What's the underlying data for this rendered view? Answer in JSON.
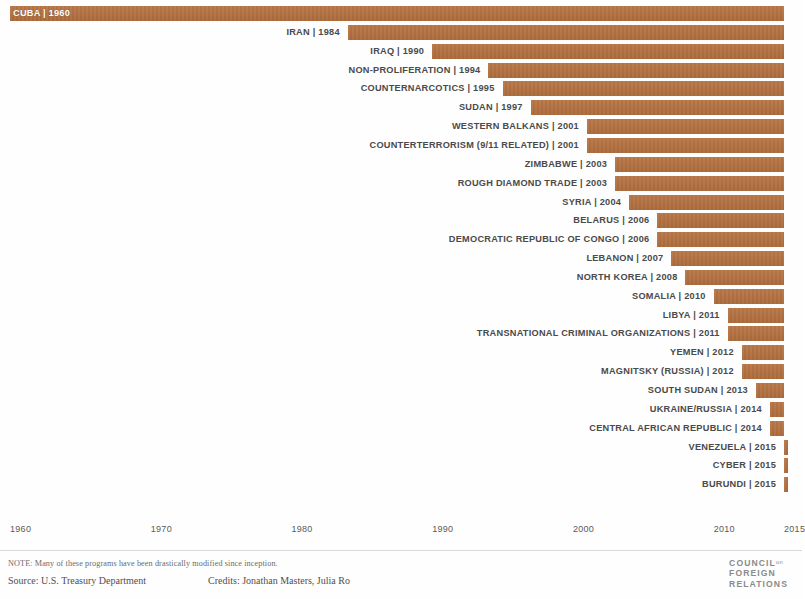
{
  "chart_data": {
    "type": "bar",
    "subtype": "gantt-timeline-horizontal",
    "title": "",
    "xlabel": "",
    "ylabel": "",
    "xlim": [
      1960,
      2015
    ],
    "grid": false,
    "legend": null,
    "bar_color": "#b5713f",
    "note": "Bars span from the program's start year to 2015 (the chart's right edge).",
    "axis_ticks": [
      "1960",
      "1970",
      "1980",
      "1990",
      "2000",
      "2010",
      "2015"
    ],
    "axis_tick_values": [
      1960,
      1970,
      1980,
      1990,
      2000,
      2010,
      2015
    ],
    "categories": [
      "CUBA",
      "IRAN",
      "IRAQ",
      "NON-PROLIFERATION",
      "COUNTERNARCOTICS",
      "SUDAN",
      "WESTERN BALKANS",
      "COUNTERTERRORISM (9/11 RELATED)",
      "ZIMBABWE",
      "ROUGH DIAMOND TRADE",
      "SYRIA",
      "BELARUS",
      "DEMOCRATIC REPUBLIC OF CONGO",
      "LEBANON",
      "NORTH KOREA",
      "SOMALIA",
      "LIBYA",
      "TRANSNATIONAL CRIMINAL ORGANIZATIONS",
      "YEMEN",
      "MAGNITSKY (RUSSIA)",
      "SOUTH SUDAN",
      "UKRAINE/RUSSIA",
      "CENTRAL AFRICAN REPUBLIC",
      "VENEZUELA",
      "CYBER",
      "BURUNDI"
    ],
    "start_years": [
      1960,
      1984,
      1990,
      1994,
      1995,
      1997,
      2001,
      2001,
      2003,
      2003,
      2004,
      2006,
      2006,
      2007,
      2008,
      2010,
      2011,
      2011,
      2012,
      2012,
      2013,
      2014,
      2014,
      2015,
      2015,
      2015
    ],
    "end_year": 2015,
    "values": [
      55,
      31,
      25,
      21,
      20,
      18,
      14,
      14,
      12,
      12,
      11,
      9,
      9,
      8,
      7,
      5,
      4,
      4,
      3,
      3,
      2,
      1,
      1,
      0,
      0,
      0
    ]
  },
  "rows": [
    {
      "label": "CUBA | 1960",
      "name": "cuba",
      "year": 1960,
      "label_inside": true
    },
    {
      "label": "IRAN | 1984",
      "name": "iran",
      "year": 1984,
      "label_inside": false
    },
    {
      "label": "IRAQ | 1990",
      "name": "iraq",
      "year": 1990,
      "label_inside": false
    },
    {
      "label": "NON-PROLIFERATION | 1994",
      "name": "non-proliferation",
      "year": 1994,
      "label_inside": false
    },
    {
      "label": "COUNTERNARCOTICS | 1995",
      "name": "counternarcotics",
      "year": 1995,
      "label_inside": false
    },
    {
      "label": "SUDAN | 1997",
      "name": "sudan",
      "year": 1997,
      "label_inside": false
    },
    {
      "label": "WESTERN BALKANS | 2001",
      "name": "western-balkans",
      "year": 2001,
      "label_inside": false
    },
    {
      "label": "COUNTERTERRORISM (9/11 RELATED) | 2001",
      "name": "counterterrorism",
      "year": 2001,
      "label_inside": false
    },
    {
      "label": "ZIMBABWE | 2003",
      "name": "zimbabwe",
      "year": 2003,
      "label_inside": false
    },
    {
      "label": "ROUGH DIAMOND TRADE | 2003",
      "name": "rough-diamond-trade",
      "year": 2003,
      "label_inside": false
    },
    {
      "label": "SYRIA | 2004",
      "name": "syria",
      "year": 2004,
      "label_inside": false
    },
    {
      "label": "BELARUS | 2006",
      "name": "belarus",
      "year": 2006,
      "label_inside": false
    },
    {
      "label": "DEMOCRATIC REPUBLIC OF CONGO | 2006",
      "name": "democratic-republic-of-congo",
      "year": 2006,
      "label_inside": false
    },
    {
      "label": "LEBANON | 2007",
      "name": "lebanon",
      "year": 2007,
      "label_inside": false
    },
    {
      "label": "NORTH KOREA | 2008",
      "name": "north-korea",
      "year": 2008,
      "label_inside": false
    },
    {
      "label": "SOMALIA | 2010",
      "name": "somalia",
      "year": 2010,
      "label_inside": false
    },
    {
      "label": "LIBYA | 2011",
      "name": "libya",
      "year": 2011,
      "label_inside": false
    },
    {
      "label": "TRANSNATIONAL CRIMINAL ORGANIZATIONS | 2011",
      "name": "transnational-criminal-organizations",
      "year": 2011,
      "label_inside": false
    },
    {
      "label": "YEMEN | 2012",
      "name": "yemen",
      "year": 2012,
      "label_inside": false
    },
    {
      "label": "MAGNITSKY (RUSSIA) | 2012",
      "name": "magnitsky-russia",
      "year": 2012,
      "label_inside": false
    },
    {
      "label": "SOUTH SUDAN | 2013",
      "name": "south-sudan",
      "year": 2013,
      "label_inside": false
    },
    {
      "label": "UKRAINE/RUSSIA | 2014",
      "name": "ukraine-russia",
      "year": 2014,
      "label_inside": false
    },
    {
      "label": "CENTRAL AFRICAN REPUBLIC | 2014",
      "name": "central-african-republic",
      "year": 2014,
      "label_inside": false
    },
    {
      "label": "VENEZUELA | 2015",
      "name": "venezuela",
      "year": 2015,
      "label_inside": false
    },
    {
      "label": "CYBER | 2015",
      "name": "cyber",
      "year": 2015,
      "label_inside": false
    },
    {
      "label": "BURUNDI | 2015",
      "name": "burundi",
      "year": 2015,
      "label_inside": false
    }
  ],
  "footer": {
    "note": "NOTE: Many of these programs have been drastically modified since inception.",
    "source": "Source: U.S. Treasury Department",
    "credits": "Credits: Jonathan Masters, Julia Ro"
  },
  "logo": {
    "line1": "COUNCIL",
    "line1_small": "on",
    "line2": "FOREIGN",
    "line3": "RELATIONS"
  }
}
